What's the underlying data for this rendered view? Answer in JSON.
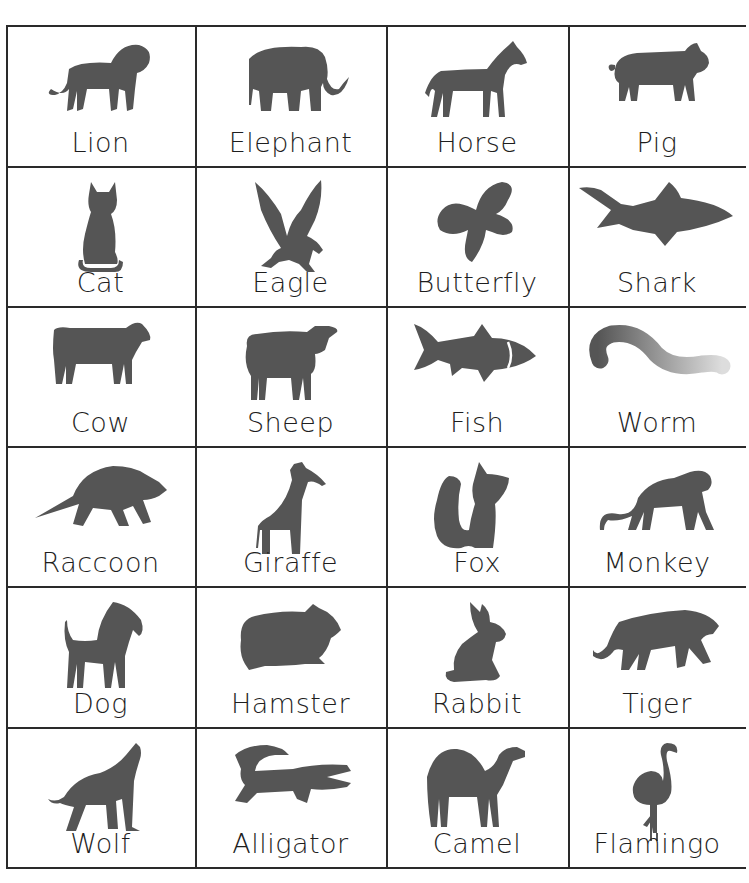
{
  "page": {
    "grid": {
      "rows": 6,
      "cols": 4
    },
    "colors": {
      "silhouette": "#555555",
      "text": "#1e1e1e",
      "lines": "#2a2a2a"
    }
  },
  "cards": [
    {
      "label": "Lion",
      "icon": "lion-icon"
    },
    {
      "label": "Elephant",
      "icon": "elephant-icon"
    },
    {
      "label": "Horse",
      "icon": "horse-icon"
    },
    {
      "label": "Pig",
      "icon": "pig-icon"
    },
    {
      "label": "Cat",
      "icon": "cat-icon"
    },
    {
      "label": "Eagle",
      "icon": "eagle-icon"
    },
    {
      "label": "Butterfly",
      "icon": "butterfly-icon"
    },
    {
      "label": "Shark",
      "icon": "shark-icon"
    },
    {
      "label": "Cow",
      "icon": "cow-icon"
    },
    {
      "label": "Sheep",
      "icon": "sheep-icon"
    },
    {
      "label": "Fish",
      "icon": "fish-icon"
    },
    {
      "label": "Worm",
      "icon": "worm-icon"
    },
    {
      "label": "Raccoon",
      "icon": "raccoon-icon"
    },
    {
      "label": "Giraffe",
      "icon": "giraffe-icon"
    },
    {
      "label": "Fox",
      "icon": "fox-icon"
    },
    {
      "label": "Monkey",
      "icon": "monkey-icon"
    },
    {
      "label": "Dog",
      "icon": "dog-icon"
    },
    {
      "label": "Hamster",
      "icon": "hamster-icon"
    },
    {
      "label": "Rabbit",
      "icon": "rabbit-icon"
    },
    {
      "label": "Tiger",
      "icon": "tiger-icon"
    },
    {
      "label": "Wolf",
      "icon": "wolf-icon"
    },
    {
      "label": "Alligator",
      "icon": "alligator-icon"
    },
    {
      "label": "Camel",
      "icon": "camel-icon"
    },
    {
      "label": "Flamingo",
      "icon": "flamingo-icon"
    }
  ]
}
